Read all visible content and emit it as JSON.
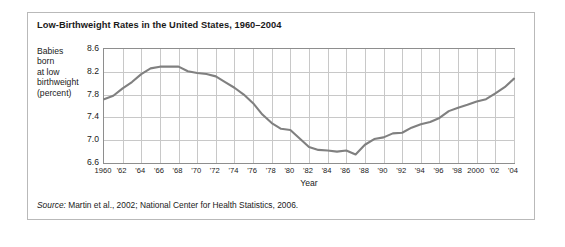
{
  "figure": {
    "title": "Low-Birthweight Rates in the United States, 1960–2004",
    "y_axis_label_lines": [
      "Babies",
      "born",
      "at low",
      "birthweight",
      "(percent)"
    ],
    "source_prefix": "Source:",
    "source_text": " Martin et al., 2002; National Center for Health Statistics, 2006."
  },
  "colors": {
    "line": "#808080",
    "grid": "#c8c8c8",
    "axis": "#8e8e8e",
    "frame": "#b9b9b9",
    "text": "#1a1a1a",
    "background": "#ffffff"
  },
  "chart_data": {
    "type": "line",
    "title": "Low-Birthweight Rates in the United States, 1960–2004",
    "xlabel": "Year",
    "ylabel": "Babies born at low birthweight (percent)",
    "xlim": [
      1960,
      2004
    ],
    "ylim": [
      6.6,
      8.6
    ],
    "yticks": [
      6.6,
      7.0,
      7.4,
      7.8,
      8.2,
      8.6
    ],
    "ytick_labels": [
      "6.6",
      "7.0",
      "7.4",
      "7.8",
      "8.2",
      "8.6"
    ],
    "xticks": [
      1960,
      1962,
      1964,
      1966,
      1968,
      1970,
      1972,
      1974,
      1976,
      1978,
      1980,
      1982,
      1984,
      1986,
      1988,
      1990,
      1992,
      1994,
      1996,
      1998,
      2000,
      2002,
      2004
    ],
    "xtick_labels": [
      "1960",
      "'62",
      "'64",
      "'66",
      "'68",
      "'70",
      "'72",
      "'74",
      "'76",
      "'78",
      "'80",
      "'82",
      "'84",
      "'86",
      "'88",
      "'90",
      "'92",
      "'94",
      "'96",
      "'98",
      "2000",
      "'02",
      "'04"
    ],
    "grid": true,
    "legend": null,
    "x": [
      1960,
      1961,
      1962,
      1963,
      1964,
      1965,
      1966,
      1967,
      1968,
      1969,
      1970,
      1971,
      1972,
      1973,
      1974,
      1975,
      1976,
      1977,
      1978,
      1979,
      1980,
      1981,
      1982,
      1983,
      1984,
      1985,
      1986,
      1987,
      1988,
      1989,
      1990,
      1991,
      1992,
      1993,
      1994,
      1995,
      1996,
      1997,
      1998,
      1999,
      2000,
      2001,
      2002,
      2003,
      2004
    ],
    "values": [
      7.72,
      7.78,
      7.91,
      8.02,
      8.16,
      8.26,
      8.29,
      8.29,
      8.29,
      8.21,
      8.18,
      8.16,
      8.12,
      8.02,
      7.92,
      7.8,
      7.65,
      7.45,
      7.3,
      7.2,
      7.18,
      7.03,
      6.88,
      6.83,
      6.82,
      6.8,
      6.82,
      6.75,
      6.92,
      7.02,
      7.05,
      7.12,
      7.13,
      7.22,
      7.28,
      7.32,
      7.39,
      7.51,
      7.57,
      7.62,
      7.68,
      7.72,
      7.82,
      7.93,
      8.08
    ]
  }
}
